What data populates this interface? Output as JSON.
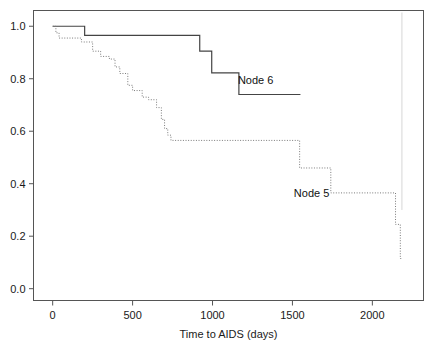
{
  "chart_data": {
    "type": "line",
    "title": "",
    "subtitle": "",
    "xlabel": "Time to AIDS (days)",
    "ylabel": "",
    "xlim": [
      -120,
      2320
    ],
    "ylim": [
      -0.045,
      1.06
    ],
    "xticks": [
      0,
      500,
      1000,
      1500,
      2000
    ],
    "xticklabels": [
      "0",
      "500",
      "1000",
      "1500",
      "2000"
    ],
    "yticks": [
      0.0,
      0.2,
      0.4,
      0.6,
      0.8,
      1.0
    ],
    "yticklabels": [
      "0.0",
      "0.2",
      "0.4",
      "0.6",
      "0.8",
      "1.0"
    ],
    "grid": false,
    "legend_position": "inline-annotation",
    "frame": "box",
    "series": [
      {
        "name": "Node 6",
        "linestyle": "solid",
        "color": "#444444",
        "label_x": 1270,
        "label_y": 0.795,
        "x": [
          0,
          200,
          200,
          920,
          920,
          995,
          995,
          1165,
          1165,
          1550
        ],
        "y": [
          1.0,
          1.0,
          0.965,
          0.965,
          0.905,
          0.905,
          0.822,
          0.822,
          0.74,
          0.74
        ],
        "steps": [
          {
            "time": 0,
            "survival": 1.0
          },
          {
            "time": 200,
            "survival": 0.965
          },
          {
            "time": 920,
            "survival": 0.905
          },
          {
            "time": 995,
            "survival": 0.822
          },
          {
            "time": 1165,
            "survival": 0.74
          }
        ],
        "end_time": 1550
      },
      {
        "name": "Node 5",
        "linestyle": "dotted",
        "color": "#7a7a7a",
        "label_x": 1620,
        "label_y": 0.365,
        "x": [
          0,
          20,
          20,
          40,
          40,
          180,
          180,
          250,
          250,
          300,
          300,
          355,
          355,
          390,
          390,
          420,
          420,
          470,
          470,
          500,
          500,
          560,
          560,
          600,
          600,
          650,
          650,
          680,
          680,
          700,
          700,
          720,
          720,
          740,
          740,
          1545,
          1545,
          1640,
          1640,
          1740,
          1740,
          2145,
          2145,
          2175,
          2175,
          2185
        ],
        "y": [
          1.0,
          1.0,
          0.975,
          0.975,
          0.955,
          0.955,
          0.94,
          0.94,
          0.905,
          0.905,
          0.885,
          0.885,
          0.875,
          0.875,
          0.845,
          0.845,
          0.82,
          0.82,
          0.775,
          0.775,
          0.755,
          0.755,
          0.73,
          0.73,
          0.72,
          0.72,
          0.69,
          0.69,
          0.645,
          0.645,
          0.61,
          0.61,
          0.585,
          0.585,
          0.565,
          0.565,
          0.46,
          0.46,
          0.46,
          0.46,
          0.365,
          0.365,
          0.245,
          0.245,
          0.115,
          0.115
        ],
        "steps": [
          {
            "time": 0,
            "survival": 1.0
          },
          {
            "time": 20,
            "survival": 0.975
          },
          {
            "time": 40,
            "survival": 0.955
          },
          {
            "time": 180,
            "survival": 0.94
          },
          {
            "time": 250,
            "survival": 0.905
          },
          {
            "time": 300,
            "survival": 0.885
          },
          {
            "time": 355,
            "survival": 0.875
          },
          {
            "time": 390,
            "survival": 0.845
          },
          {
            "time": 420,
            "survival": 0.82
          },
          {
            "time": 470,
            "survival": 0.775
          },
          {
            "time": 500,
            "survival": 0.755
          },
          {
            "time": 560,
            "survival": 0.73
          },
          {
            "time": 600,
            "survival": 0.72
          },
          {
            "time": 650,
            "survival": 0.69
          },
          {
            "time": 680,
            "survival": 0.645
          },
          {
            "time": 700,
            "survival": 0.61
          },
          {
            "time": 720,
            "survival": 0.585
          },
          {
            "time": 740,
            "survival": 0.565
          },
          {
            "time": 1545,
            "survival": 0.46
          },
          {
            "time": 1740,
            "survival": 0.365
          },
          {
            "time": 2145,
            "survival": 0.245
          },
          {
            "time": 2175,
            "survival": 0.115
          }
        ],
        "end_time": 2185
      }
    ],
    "annotations": [
      {
        "text": "Node 6",
        "x": 1270,
        "y": 0.795
      },
      {
        "text": "Node 5",
        "x": 1620,
        "y": 0.365
      }
    ]
  }
}
